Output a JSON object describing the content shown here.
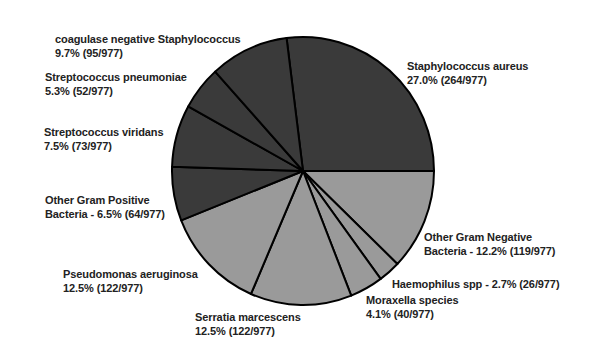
{
  "chart_data": {
    "type": "pie",
    "title": "",
    "total": 977,
    "start_angle_deg": -7.2,
    "direction": "clockwise",
    "colors": {
      "gram_positive": "#3a3a3a",
      "gram_negative": "#9a9a9a",
      "outline": "#000000"
    },
    "slices": [
      {
        "name": "Staphylococcus aureus",
        "percent": 27.0,
        "count": 264,
        "group": "gram_positive",
        "line1": "Staphylococcus aureus",
        "line2": "27.0% (264/977)",
        "label_x": 407,
        "label_y": 59
      },
      {
        "name": "Other Gram Negative Bacteria",
        "percent": 12.2,
        "count": 119,
        "group": "gram_negative",
        "line1": "Other Gram Negative",
        "line2": "Bacteria - 12.2% (119/977)",
        "label_x": 424,
        "label_y": 230
      },
      {
        "name": "Haemophilus spp",
        "percent": 2.7,
        "count": 26,
        "group": "gram_negative",
        "line1": "Haemophilus spp - 2.7% (26/977)",
        "line2": "",
        "label_x": 392,
        "label_y": 277
      },
      {
        "name": "Moraxella species",
        "percent": 4.1,
        "count": 40,
        "group": "gram_negative",
        "line1": "Moraxella species",
        "line2": "4.1% (40/977)",
        "label_x": 366,
        "label_y": 293
      },
      {
        "name": "Serratia marcescens",
        "percent": 12.5,
        "count": 122,
        "group": "gram_negative",
        "line1": "Serratia marcescens",
        "line2": "12.5% (122/977)",
        "label_x": 195,
        "label_y": 310
      },
      {
        "name": "Pseudomonas aeruginosa",
        "percent": 12.5,
        "count": 122,
        "group": "gram_negative",
        "line1": "Pseudomonas aeruginosa",
        "line2": "12.5% (122/977)",
        "label_x": 63,
        "label_y": 267
      },
      {
        "name": "Other Gram Positive Bacteria",
        "percent": 6.5,
        "count": 64,
        "group": "gram_positive",
        "line1": "Other Gram Positive",
        "line2": "Bacteria - 6.5% (64/977)",
        "label_x": 45,
        "label_y": 193
      },
      {
        "name": "Streptococcus viridans",
        "percent": 7.5,
        "count": 73,
        "group": "gram_positive",
        "line1": "Streptococcus viridans",
        "line2": "7.5% (73/977)",
        "label_x": 44,
        "label_y": 125
      },
      {
        "name": "Streptococcus pneumoniae",
        "percent": 5.3,
        "count": 52,
        "group": "gram_positive",
        "line1": "Streptococcus pneumoniae",
        "line2": "5.3% (52/977)",
        "label_x": 45,
        "label_y": 70
      },
      {
        "name": "coagulase negative Staphylococcus",
        "percent": 9.7,
        "count": 95,
        "group": "gram_positive",
        "line1": "coagulase negative Staphylococcus",
        "line2": "9.7% (95/977)",
        "label_x": 55,
        "label_y": 32
      }
    ],
    "geometry": {
      "cx": 303,
      "cy": 171,
      "rx": 131,
      "ry": 134
    }
  }
}
